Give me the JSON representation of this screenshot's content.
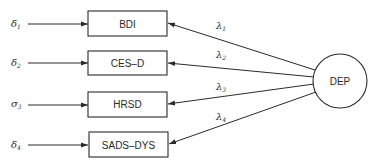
{
  "diagram": {
    "type": "structural-equation-measurement-model",
    "latent": {
      "label": "DEP"
    },
    "indicators": [
      {
        "label": "BDI",
        "error": "δ",
        "error_sub": "1",
        "loading": "λ",
        "loading_sub": "1"
      },
      {
        "label": "CES–D",
        "error": "δ",
        "error_sub": "2",
        "loading": "λ",
        "loading_sub": "2"
      },
      {
        "label": "HRSD",
        "error": "σ",
        "error_sub": "3",
        "loading": "λ",
        "loading_sub": "3"
      },
      {
        "label": "SADS–DYS",
        "error": "δ",
        "error_sub": "4",
        "loading": "λ",
        "loading_sub": "4"
      }
    ],
    "colors": {
      "stroke": "#2a2a2a",
      "background": "#ffffff"
    }
  }
}
